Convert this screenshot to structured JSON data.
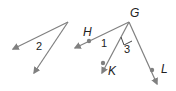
{
  "diagram": {
    "figure_left": {
      "angle_label": "2"
    },
    "figure_right": {
      "vertex_label": "G",
      "points": [
        "H",
        "K",
        "L"
      ],
      "angle_labels": [
        "1",
        "3"
      ],
      "right_angle": "KGL"
    },
    "colors": {
      "ray": "#808080",
      "text": "#222222"
    }
  }
}
